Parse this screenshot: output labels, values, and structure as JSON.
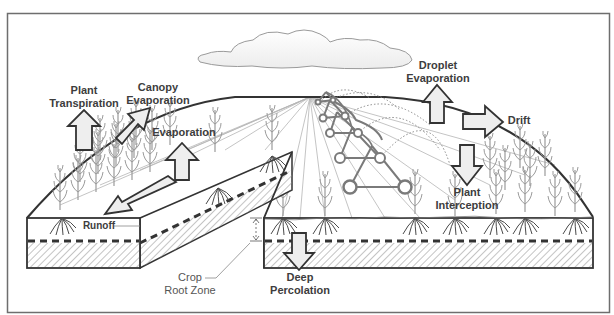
{
  "diagram": {
    "labels": {
      "plant_transpiration": [
        "Plant",
        "Transpiration"
      ],
      "canopy_evaporation": [
        "Canopy",
        "Evaporation"
      ],
      "evaporation": [
        "Evaporation"
      ],
      "droplet_evaporation": [
        "Droplet",
        "Evaporation"
      ],
      "drift": [
        "Drift"
      ],
      "plant_interception": [
        "Plant",
        "Interception"
      ],
      "runoff": [
        "Runoff"
      ],
      "crop_root_zone": [
        "Crop",
        "Root Zone"
      ],
      "deep_percolation": [
        "Deep",
        "Percolation"
      ]
    },
    "colors": {
      "frame": "#6e6e6e",
      "outline": "#333333",
      "arrow_fill": "#eeeeee",
      "label_text": "#3d3d3d",
      "pivot": "#7a7a7a",
      "crop": "#9a9a9a",
      "hatch": "#8a8a8a"
    }
  }
}
